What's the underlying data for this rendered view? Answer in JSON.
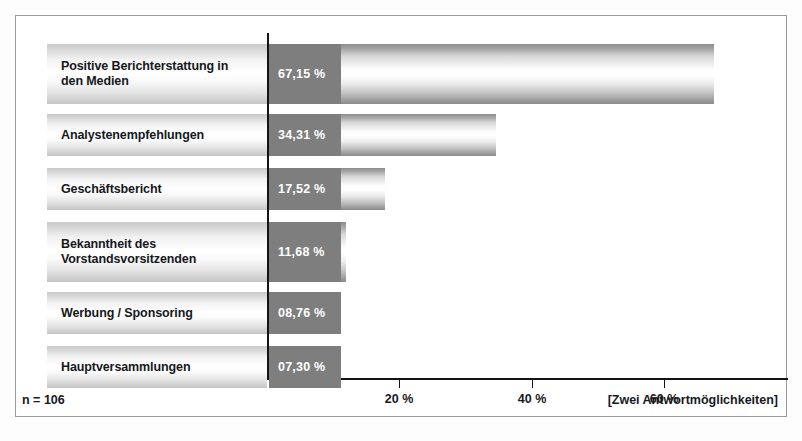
{
  "chart_data": {
    "type": "bar",
    "orientation": "horizontal",
    "title": "",
    "xlabel": "",
    "ylabel": "",
    "categories": [
      "Positive Berichterstattung in\nden Medien",
      "Analystenempfehlungen",
      "Geschäftsbericht",
      "Bekanntheit des\nVorstandsvorsitzenden",
      "Werbung / Sponsoring",
      "Hauptversammlungen"
    ],
    "values": [
      67.15,
      34.31,
      17.52,
      11.68,
      8.76,
      7.3
    ],
    "value_labels": [
      "67,15 %",
      "34,31 %",
      "17,52 %",
      "11,68 %",
      "08,76 %",
      "07,30 %"
    ],
    "xlim": [
      0,
      76
    ],
    "xticks": [
      20,
      40,
      60
    ],
    "xtick_labels": [
      "20 %",
      "40 %",
      "60 %"
    ],
    "grid": false,
    "legend": null
  },
  "footer": {
    "sample_size": "n = 106",
    "note": "[Zwei Antwortmöglichkeiten]"
  },
  "colors": {
    "bar_head": "#7e7e7e",
    "axis": "#141414",
    "text": "#17191d",
    "value_text": "#ffffff",
    "frame": "#9a9a9a"
  }
}
